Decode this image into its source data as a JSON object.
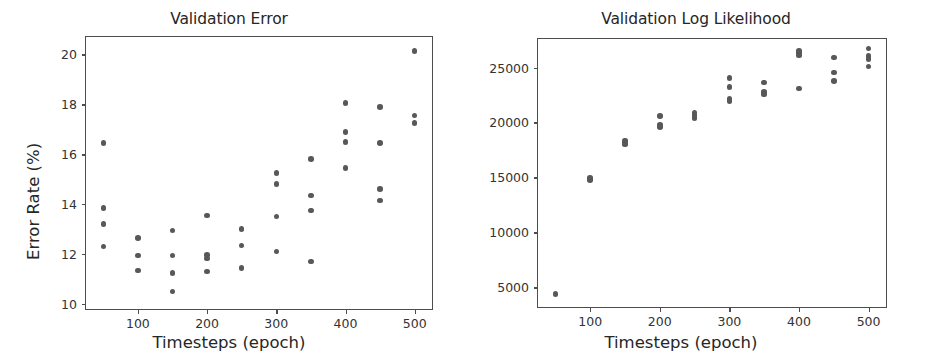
{
  "figure": {
    "background": "#ffffff",
    "marker_color": "#585858",
    "axis_color": "#4d4d4d",
    "text_color": "#262626"
  },
  "chart_data": [
    {
      "type": "scatter",
      "title": "Validation Error",
      "xlabel": "Timesteps (epoch)",
      "ylabel": "Error Rate (%)",
      "xlim": [
        25,
        525
      ],
      "ylim": [
        9.8,
        20.7
      ],
      "xticks": [
        100,
        200,
        300,
        400,
        500
      ],
      "xticklabels": [
        "100",
        "200",
        "300",
        "400",
        "500"
      ],
      "yticks": [
        10,
        12,
        14,
        16,
        18,
        20
      ],
      "yticklabels": [
        "10",
        "12",
        "14",
        "16",
        "18",
        "20"
      ],
      "grid": false,
      "legend": "none",
      "marker_color": "#585858",
      "points": [
        {
          "x": 50,
          "y": 16.45
        },
        {
          "x": 50,
          "y": 13.85
        },
        {
          "x": 50,
          "y": 13.2
        },
        {
          "x": 50,
          "y": 12.3
        },
        {
          "x": 100,
          "y": 12.65
        },
        {
          "x": 100,
          "y": 11.95
        },
        {
          "x": 100,
          "y": 11.35
        },
        {
          "x": 150,
          "y": 12.95
        },
        {
          "x": 150,
          "y": 11.95
        },
        {
          "x": 150,
          "y": 11.25
        },
        {
          "x": 150,
          "y": 10.5
        },
        {
          "x": 200,
          "y": 13.55
        },
        {
          "x": 200,
          "y": 11.97
        },
        {
          "x": 200,
          "y": 11.82
        },
        {
          "x": 200,
          "y": 11.3
        },
        {
          "x": 250,
          "y": 13.0
        },
        {
          "x": 250,
          "y": 12.35
        },
        {
          "x": 250,
          "y": 11.45
        },
        {
          "x": 300,
          "y": 15.25
        },
        {
          "x": 300,
          "y": 14.8
        },
        {
          "x": 300,
          "y": 13.5
        },
        {
          "x": 300,
          "y": 12.1
        },
        {
          "x": 350,
          "y": 15.8
        },
        {
          "x": 350,
          "y": 14.35
        },
        {
          "x": 350,
          "y": 13.75
        },
        {
          "x": 350,
          "y": 11.7
        },
        {
          "x": 400,
          "y": 18.05
        },
        {
          "x": 400,
          "y": 16.9
        },
        {
          "x": 400,
          "y": 16.5
        },
        {
          "x": 400,
          "y": 15.45
        },
        {
          "x": 450,
          "y": 17.9
        },
        {
          "x": 450,
          "y": 16.45
        },
        {
          "x": 450,
          "y": 14.6
        },
        {
          "x": 450,
          "y": 14.15
        },
        {
          "x": 500,
          "y": 20.15
        },
        {
          "x": 500,
          "y": 17.55
        },
        {
          "x": 500,
          "y": 17.25
        }
      ]
    },
    {
      "type": "scatter",
      "title": "Validation Log Likelihood",
      "xlabel": "Timesteps (epoch)",
      "ylabel": "Log Likelihood",
      "xlim": [
        25,
        525
      ],
      "ylim": [
        3200,
        27600
      ],
      "xticks": [
        100,
        200,
        300,
        400,
        500
      ],
      "xticklabels": [
        "100",
        "200",
        "300",
        "400",
        "500"
      ],
      "yticks": [
        5000,
        10000,
        15000,
        20000,
        25000
      ],
      "yticklabels": [
        "5000",
        "10000",
        "15000",
        "20000",
        "25000"
      ],
      "grid": false,
      "legend": "none",
      "marker_color": "#585858",
      "points": [
        {
          "x": 50,
          "y": 4400
        },
        {
          "x": 100,
          "y": 14950
        },
        {
          "x": 100,
          "y": 14780
        },
        {
          "x": 150,
          "y": 18350
        },
        {
          "x": 150,
          "y": 18150
        },
        {
          "x": 150,
          "y": 18000
        },
        {
          "x": 200,
          "y": 20600
        },
        {
          "x": 200,
          "y": 19750
        },
        {
          "x": 200,
          "y": 19570
        },
        {
          "x": 250,
          "y": 20900
        },
        {
          "x": 250,
          "y": 20700
        },
        {
          "x": 250,
          "y": 20400
        },
        {
          "x": 300,
          "y": 24050
        },
        {
          "x": 300,
          "y": 23250
        },
        {
          "x": 300,
          "y": 22150
        },
        {
          "x": 300,
          "y": 21950
        },
        {
          "x": 350,
          "y": 23650
        },
        {
          "x": 350,
          "y": 22750
        },
        {
          "x": 350,
          "y": 22550
        },
        {
          "x": 400,
          "y": 26500
        },
        {
          "x": 400,
          "y": 26300
        },
        {
          "x": 400,
          "y": 26100
        },
        {
          "x": 400,
          "y": 23100
        },
        {
          "x": 450,
          "y": 25900
        },
        {
          "x": 450,
          "y": 24550
        },
        {
          "x": 450,
          "y": 23800
        },
        {
          "x": 500,
          "y": 26750
        },
        {
          "x": 500,
          "y": 26050
        },
        {
          "x": 500,
          "y": 25800
        },
        {
          "x": 500,
          "y": 25100
        }
      ]
    }
  ]
}
